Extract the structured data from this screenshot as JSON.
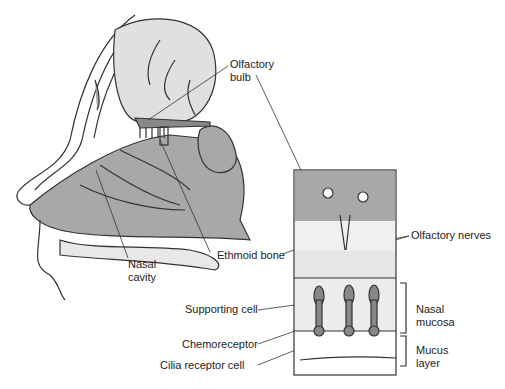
{
  "diagram": {
    "colors": {
      "tissue": "#a8a8a8",
      "light": "#e8e8e8",
      "line": "#333333",
      "box_fill": "#f2f2f2"
    },
    "labels": {
      "olfactory_bulb": [
        "Olfactory",
        "bulb"
      ],
      "nasal_cavity": [
        "Nasal",
        "cavity"
      ],
      "ethmoid_bone": "Ethmoid bone",
      "olfactory_nerves": "Olfactory nerves",
      "supporting_cell": "Supporting cell",
      "chemoreceptor": "Chemoreceptor",
      "cilia_receptor_cell": "Cilia receptor cell",
      "nasal_mucosa": [
        "Nasal",
        "mucosa"
      ],
      "mucus_layer": [
        "Mucus",
        "layer"
      ]
    }
  }
}
